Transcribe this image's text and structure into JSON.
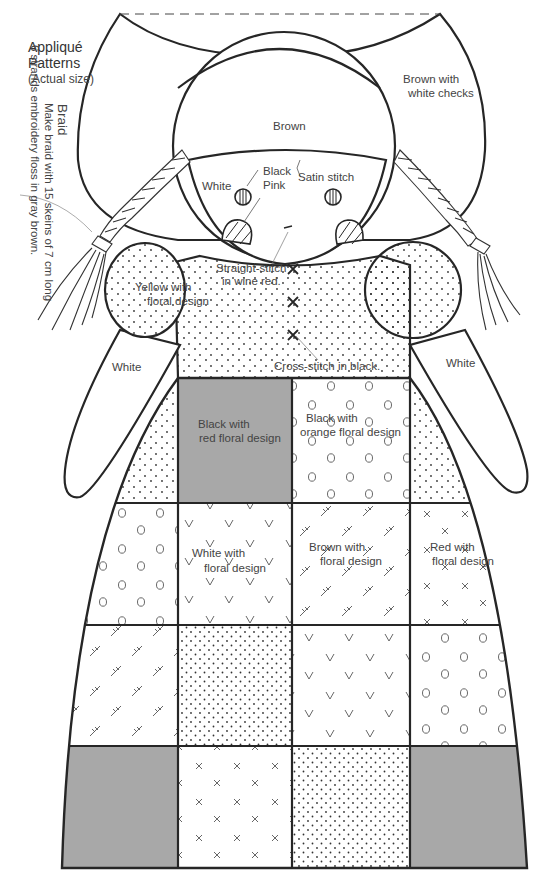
{
  "title": {
    "line1": "Appliqué",
    "line2": "Patterns",
    "subtitle": "(Actual size)"
  },
  "braid_note": {
    "heading": "Braid",
    "line1": "Make braid with 15 skeins of 7 cm long",
    "line2": "6 strands embroidery floss in gray brown."
  },
  "labels": {
    "bonnet_brim": "Brown with\nwhite checks",
    "bonnet_brim_l1": "Brown with",
    "bonnet_brim_l2": "white checks",
    "hair": "Brown",
    "face": "White",
    "eyes": "Black",
    "cheeks": "Pink",
    "satin": "Satin stitch",
    "mouth_l1": "Straight-stitch",
    "mouth_l2": "in wine red.",
    "sleeve_l1": "Yellow with",
    "sleeve_l2": "floral design",
    "cross_stitch": "Cross-stitch in black.",
    "arm_left": "White",
    "arm_right": "White",
    "patch_black_red_l1": "Black with",
    "patch_black_red_l2": "red floral design",
    "patch_black_orange_l1": "Black with",
    "patch_black_orange_l2": "orange floral design",
    "patch_white_l1": "White with",
    "patch_white_l2": "floral design",
    "patch_brown_l1": "Brown  with",
    "patch_brown_l2": "floral design",
    "patch_red_l1": "Red with",
    "patch_red_l2": "floral design"
  },
  "colors": {
    "line": "#262626",
    "gray_fill": "#a8a8a8",
    "dot": "#333333",
    "text": "#444444"
  },
  "quilt_grid": {
    "rows": [
      [
        "dotted",
        "gray",
        "circles",
        "dotted"
      ],
      [
        "circles",
        "v-marks",
        "cross-ticks",
        "x-marks"
      ],
      [
        "cross-ticks",
        "dotted",
        "v-marks",
        "circles"
      ],
      [
        "gray",
        "x-marks",
        "dotted",
        "gray"
      ]
    ]
  }
}
